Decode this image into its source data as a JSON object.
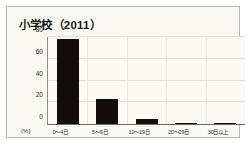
{
  "chart_data": {
    "type": "bar",
    "title": "小学校（2011）",
    "xlabel": "",
    "ylabel": "",
    "unit_label": "(%)",
    "categories": [
      "0〜4日",
      "5〜9日",
      "10〜19日",
      "20〜29日",
      "30日以上"
    ],
    "values": [
      78,
      23,
      5,
      1,
      1
    ],
    "ylim": [
      0,
      80
    ],
    "yticks": [
      0,
      20,
      40,
      60,
      80
    ],
    "ytick_labels": [
      "0",
      "20",
      "40",
      "60",
      "80"
    ],
    "grid": true,
    "legend": "none",
    "bar_color": "#120d0a",
    "panel_color": "#faf8f2",
    "frame_color": "#b9b6ae"
  }
}
